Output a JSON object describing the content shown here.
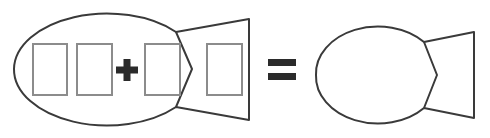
{
  "figure": {
    "title": "Fish equation: four cards inside a fish equal an empty fish",
    "background_color": "#ffffff",
    "stroke_color": "#3a3a3a",
    "card_stroke_color": "#8c8c8c",
    "glyph_color": "#2b2b2b",
    "stroke_width": 2,
    "card_stroke_width": 2
  },
  "left_group": {
    "name": "fish-with-cards",
    "fish": {
      "label": "fish-outline-left",
      "body": {
        "cx": 107,
        "cy": 69,
        "rx": 93,
        "ry": 56
      },
      "tail": {
        "notch_x": 192,
        "notch_y": 69,
        "tip_x": 249,
        "top_y": 19,
        "bottom_y": 120,
        "join_top_x": 176,
        "join_top_y": 32,
        "join_bottom_x": 176,
        "join_bottom_y": 107
      }
    },
    "cards": [
      {
        "label": "card-1",
        "x": 33,
        "y": 44,
        "width": 34,
        "height": 51
      },
      {
        "label": "card-2",
        "x": 77,
        "y": 44,
        "width": 35,
        "height": 51
      },
      {
        "label": "card-3",
        "x": 145,
        "y": 44,
        "width": 35,
        "height": 51
      },
      {
        "label": "card-4",
        "x": 207,
        "y": 44,
        "width": 35,
        "height": 51
      }
    ],
    "plus_operator": {
      "label": "plus-sign",
      "symbol": "+",
      "cx": 127,
      "cy": 70,
      "arm_length": 11,
      "arm_thickness": 7
    }
  },
  "equals_operator": {
    "label": "equals-sign",
    "symbol": "=",
    "x": 268,
    "y_top": 59,
    "y_bottom": 73,
    "width": 28,
    "bar_thickness": 7
  },
  "right_group": {
    "name": "fish-empty",
    "fish": {
      "label": "fish-outline-right",
      "body": {
        "cx": 378,
        "cy": 75,
        "rx": 62,
        "ry": 47
      },
      "tail": {
        "notch_x": 437,
        "notch_y": 75,
        "tip_x": 474,
        "top_y": 32,
        "bottom_y": 118,
        "join_top_x": 424,
        "join_top_y": 42,
        "join_bottom_x": 424,
        "join_bottom_y": 108
      }
    }
  },
  "legend": {
    "operators": [
      "+",
      "="
    ],
    "shape_count": 2,
    "card_count": 4
  }
}
